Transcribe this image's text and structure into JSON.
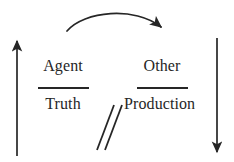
{
  "figure": {
    "type": "proportion-diagram",
    "background_color": "#ffffff",
    "ink_color": "#262626",
    "left_fraction": {
      "numerator": "Agent",
      "denominator": "Truth"
    },
    "right_fraction": {
      "numerator": "Other",
      "denominator": "Production"
    },
    "relation": {
      "symbol": "//",
      "name": "double-slash-not-equal-mark"
    },
    "arrows": [
      {
        "name": "top-curved-arrow",
        "direction": "left-to-right",
        "shape": "arc"
      },
      {
        "name": "left-vertical-arrow",
        "direction": "up",
        "shape": "straight"
      },
      {
        "name": "right-vertical-arrow",
        "direction": "down",
        "shape": "straight"
      }
    ]
  }
}
